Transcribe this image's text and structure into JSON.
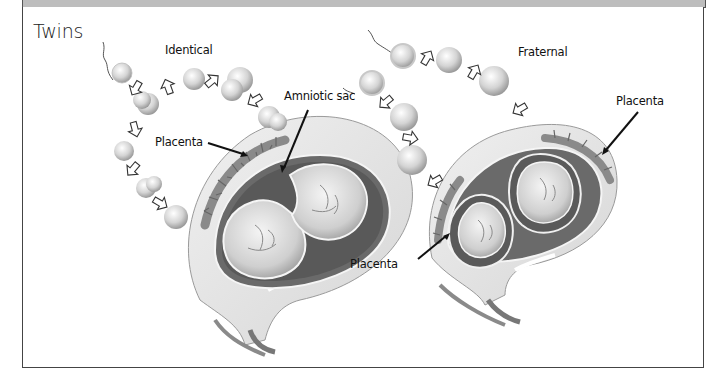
{
  "figure": {
    "title": "Twins",
    "panels": [
      {
        "id": "identical",
        "heading": "Identical",
        "labels": [
          "Amniotic sac",
          "Placenta"
        ]
      },
      {
        "id": "fraternal",
        "heading": "Fraternal",
        "labels": [
          "Placenta",
          "Placenta"
        ]
      }
    ]
  },
  "colors": {
    "frame_border": "#444444",
    "top_bar": "#bdbdbd",
    "uterus_wall": "#e6e6e6",
    "uterus_dark": "#6a6a6a",
    "placenta": "#7a7a7a",
    "sac": "#f2f2f2",
    "text": "#111111"
  }
}
